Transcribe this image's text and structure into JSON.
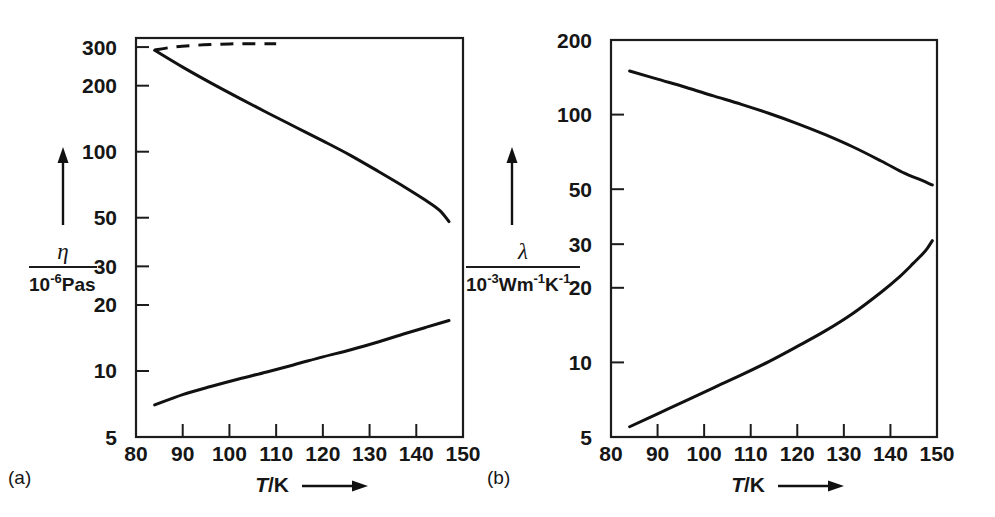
{
  "figure": {
    "background": "#ffffff",
    "ink_color": "#111111",
    "panels": [
      {
        "id": "a",
        "label": "(a)",
        "label_pos": {
          "x": 8,
          "y": 484
        },
        "frame": {
          "x": 136,
          "y": 38,
          "w": 327,
          "h": 399
        },
        "y_axis": {
          "scale": "log",
          "caption_symbol": "η",
          "caption_unit_mantissa": "10",
          "caption_unit_exponent": "-6",
          "caption_unit_rest": "Pas",
          "caption_full": "η / 10⁻⁶Pas",
          "ticks": [
            300,
            200,
            100,
            50,
            30,
            20,
            10,
            5
          ],
          "tick_labels": [
            "300",
            "200",
            "100",
            "50",
            "30",
            "20",
            "10",
            "5"
          ],
          "range": [
            5,
            330
          ]
        },
        "x_axis": {
          "scale": "linear",
          "caption_symbol": "T",
          "caption_unit": "/K",
          "caption_full": "T/K",
          "ticks": [
            80,
            90,
            100,
            110,
            120,
            130,
            140,
            150
          ],
          "tick_labels": [
            "80",
            "90",
            "100",
            "110",
            "120",
            "130",
            "140",
            "150"
          ],
          "range": [
            80,
            150
          ]
        }
      },
      {
        "id": "b",
        "label": "(b)",
        "label_pos": {
          "x": 487,
          "y": 484
        },
        "frame": {
          "x": 611,
          "y": 40,
          "w": 326,
          "h": 397
        },
        "y_axis": {
          "scale": "log",
          "caption_symbol": "λ",
          "caption_unit_mantissa": "10",
          "caption_unit_exponent": "-3",
          "caption_unit_rest": "Wm",
          "caption_unit_exp2": "-1",
          "caption_unit_rest2": "K",
          "caption_unit_exp3": "-1",
          "caption_full": "λ / 10⁻³Wm⁻¹K⁻¹",
          "ticks": [
            200,
            100,
            50,
            30,
            20,
            10,
            5
          ],
          "tick_labels": [
            "200",
            "100",
            "50",
            "30",
            "20",
            "10",
            "5"
          ],
          "range": [
            5,
            200
          ]
        },
        "x_axis": {
          "scale": "linear",
          "caption_symbol": "T",
          "caption_unit": "/K",
          "caption_full": "T/K",
          "ticks": [
            80,
            90,
            100,
            110,
            120,
            130,
            140,
            150
          ],
          "tick_labels": [
            "80",
            "90",
            "100",
            "110",
            "120",
            "130",
            "140",
            "150"
          ],
          "range": [
            80,
            150
          ]
        }
      }
    ]
  },
  "chart_data": [
    {
      "type": "line",
      "panel": "a",
      "title": "",
      "xlabel": "T/K",
      "ylabel": "η / 10⁻⁶Pas",
      "xscale": "linear",
      "yscale": "log",
      "xlim": [
        80,
        150
      ],
      "ylim": [
        5,
        330
      ],
      "xticks": [
        80,
        90,
        100,
        110,
        120,
        130,
        140,
        150
      ],
      "yticks": [
        300,
        200,
        100,
        50,
        30,
        20,
        10,
        5
      ],
      "grid": false,
      "legend": "none",
      "series": [
        {
          "name": "saturated-liquid-viscosity-extrapolated",
          "style": "dashed",
          "x": [
            84,
            88,
            92,
            96,
            100,
            104,
            108,
            110
          ],
          "y": [
            291,
            300,
            305,
            308,
            310,
            311,
            311,
            311
          ]
        },
        {
          "name": "liquid-viscosity",
          "style": "solid",
          "x": [
            84,
            90,
            96,
            102,
            108,
            114,
            120,
            126,
            132,
            138,
            142,
            145,
            147
          ],
          "y": [
            290,
            243,
            206,
            176,
            151,
            130,
            112,
            96,
            81,
            68,
            60,
            54,
            48
          ]
        },
        {
          "name": "vapour-viscosity",
          "style": "solid",
          "x": [
            84,
            90,
            96,
            102,
            108,
            114,
            120,
            126,
            132,
            138,
            142,
            145,
            147
          ],
          "y": [
            7.0,
            7.8,
            8.5,
            9.2,
            9.9,
            10.7,
            11.6,
            12.5,
            13.6,
            14.9,
            15.8,
            16.5,
            17.0
          ]
        }
      ]
    },
    {
      "type": "line",
      "panel": "b",
      "title": "",
      "xlabel": "T/K",
      "ylabel": "λ / 10⁻³Wm⁻¹K⁻¹",
      "xscale": "linear",
      "yscale": "log",
      "xlim": [
        80,
        150
      ],
      "ylim": [
        5,
        200
      ],
      "xticks": [
        80,
        90,
        100,
        110,
        120,
        130,
        140,
        150
      ],
      "yticks": [
        200,
        100,
        50,
        30,
        20,
        10,
        5
      ],
      "grid": false,
      "legend": "none",
      "series": [
        {
          "name": "liquid-thermal-conductivity",
          "style": "solid",
          "x": [
            84,
            90,
            96,
            102,
            108,
            114,
            120,
            126,
            132,
            138,
            143,
            146,
            149
          ],
          "y": [
            150,
            139,
            129,
            119,
            110,
            101,
            92,
            83,
            74,
            65,
            58,
            55,
            52
          ]
        },
        {
          "name": "vapour-thermal-conductivity",
          "style": "solid",
          "x": [
            84,
            90,
            96,
            102,
            108,
            114,
            120,
            126,
            132,
            138,
            142,
            145,
            147,
            148,
            149
          ],
          "y": [
            5.5,
            6.2,
            7.0,
            7.9,
            8.9,
            10.1,
            11.6,
            13.4,
            15.8,
            19.2,
            22.2,
            25.2,
            27.5,
            29.0,
            31.0
          ]
        }
      ]
    }
  ]
}
